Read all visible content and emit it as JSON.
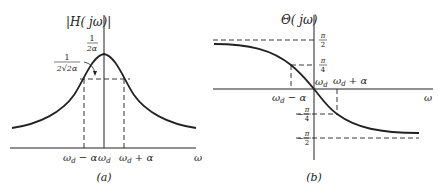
{
  "colors": {
    "ink": "#222222",
    "background": "#ffffff"
  },
  "panel_a": {
    "caption": "(a)",
    "y_axis_label": "|H( jω)|",
    "peak_label": {
      "num": "1",
      "den": "2α"
    },
    "half_power_label": {
      "num": "1",
      "den": "2√2α"
    },
    "x_axis_label": "ω",
    "ticks": [
      {
        "base": "ω",
        "sub": "d",
        "suffix": " − α"
      },
      {
        "base": "ω",
        "sub": "d",
        "suffix": ""
      },
      {
        "base": "ω",
        "sub": "d",
        "suffix": " + α"
      }
    ]
  },
  "panel_b": {
    "caption": "(b)",
    "y_axis_label": "Θ( jω)",
    "x_axis_label": "ω",
    "y_ticks": [
      {
        "sign": "",
        "num": "π",
        "den": "2"
      },
      {
        "sign": "",
        "num": "π",
        "den": "4"
      },
      {
        "sign": "−",
        "num": "π",
        "den": "4"
      },
      {
        "sign": "−",
        "num": "π",
        "den": "2"
      }
    ],
    "x_ticks": [
      {
        "base": "ω",
        "sub": "d",
        "suffix": " − α"
      },
      {
        "base": "ω",
        "sub": "d",
        "suffix": ""
      },
      {
        "base": "ω",
        "sub": "d",
        "suffix": " + α"
      }
    ]
  }
}
